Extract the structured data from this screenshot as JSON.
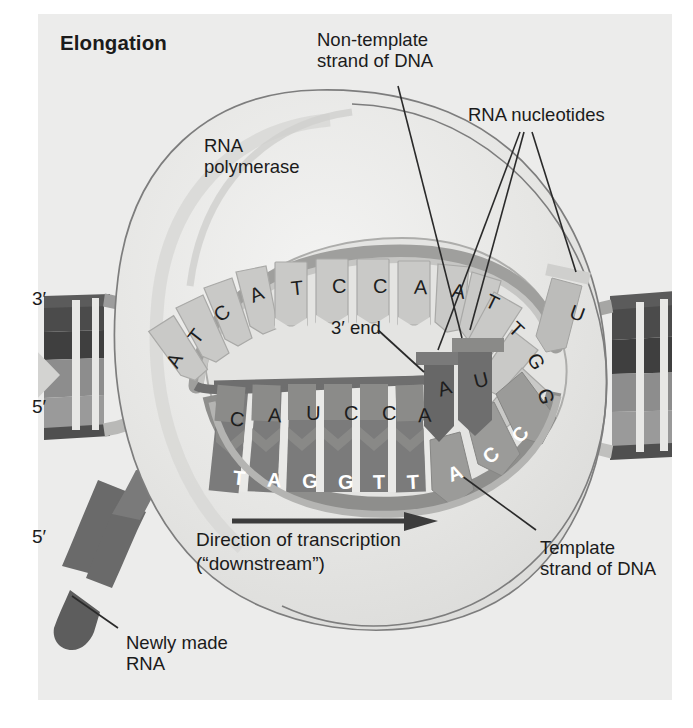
{
  "figure": {
    "title": "Elongation",
    "background_color": "#ececeb",
    "page_color": "#ffffff"
  },
  "callouts": {
    "rna_polymerase": "RNA\npolymerase",
    "non_template": "Non-template\nstrand of DNA",
    "rna_nucleotides": "RNA nucleotides",
    "three_prime_end": "3′ end",
    "template": "Template\nstrand of DNA",
    "newly_made_rna": "Newly made\nRNA",
    "direction_line1": "Direction of transcription",
    "direction_line2": "(“downstream”)"
  },
  "end_labels": {
    "dna_top_left": "3′",
    "dna_bottom_left": "5′",
    "rna_left": "5′"
  },
  "sequences": {
    "non_template_strand": [
      "A",
      "T",
      "C",
      "A",
      "T",
      "C",
      "C",
      "A",
      "A",
      "T",
      "T",
      "G",
      "G",
      "U"
    ],
    "rna_transcript": [
      "C",
      "A",
      "U",
      "C",
      "C",
      "A",
      "A",
      "U"
    ],
    "template_strand": [
      "T",
      "A",
      "G",
      "G",
      "T",
      "T",
      "A",
      "C",
      "C"
    ]
  },
  "colors": {
    "dark_dna": "#4b4b4b",
    "mid_gray": "#8a8a8a",
    "light_gray": "#bdbdbd",
    "pale_gray": "#d6d6d4",
    "rna_gray": "#6f6f6f",
    "bubble_outline": "#6e6e6e",
    "text": "#1b1b1b",
    "white_letter": "#ffffff"
  },
  "bases": {
    "non_template": [
      {
        "letter": "A",
        "x": 168,
        "y": 349
      },
      {
        "letter": "T",
        "x": 190,
        "y": 325
      },
      {
        "letter": "C",
        "x": 215,
        "y": 302
      },
      {
        "letter": "A",
        "x": 250,
        "y": 283
      },
      {
        "letter": "T",
        "x": 291,
        "y": 277
      },
      {
        "letter": "C",
        "x": 332,
        "y": 275
      },
      {
        "letter": "C",
        "x": 373,
        "y": 275
      },
      {
        "letter": "A",
        "x": 414,
        "y": 276
      },
      {
        "letter": "A",
        "x": 452,
        "y": 280
      },
      {
        "letter": "T",
        "x": 486,
        "y": 291
      },
      {
        "letter": "T",
        "x": 510,
        "y": 318
      },
      {
        "letter": "G",
        "x": 528,
        "y": 350
      },
      {
        "letter": "G",
        "x": 538,
        "y": 385
      },
      {
        "letter": "U",
        "x": 570,
        "y": 302
      }
    ],
    "rna": [
      {
        "letter": "C",
        "x": 230,
        "y": 408
      },
      {
        "letter": "A",
        "x": 268,
        "y": 404
      },
      {
        "letter": "U",
        "x": 306,
        "y": 402
      },
      {
        "letter": "C",
        "x": 344,
        "y": 402
      },
      {
        "letter": "C",
        "x": 382,
        "y": 402
      },
      {
        "letter": "A",
        "x": 418,
        "y": 404
      },
      {
        "letter": "A",
        "x": 438,
        "y": 377
      },
      {
        "letter": "U",
        "x": 474,
        "y": 369
      }
    ],
    "template": [
      {
        "letter": "T",
        "x": 233,
        "y": 467
      },
      {
        "letter": "A",
        "x": 267,
        "y": 469
      },
      {
        "letter": "G",
        "x": 302,
        "y": 470
      },
      {
        "letter": "G",
        "x": 338,
        "y": 471
      },
      {
        "letter": "T",
        "x": 373,
        "y": 471
      },
      {
        "letter": "T",
        "x": 407,
        "y": 471
      },
      {
        "letter": "A",
        "x": 448,
        "y": 462
      },
      {
        "letter": "C",
        "x": 484,
        "y": 444
      },
      {
        "letter": "C",
        "x": 513,
        "y": 423
      }
    ]
  }
}
